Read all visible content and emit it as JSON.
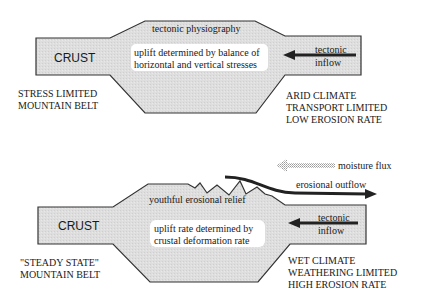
{
  "colors": {
    "crust_fill": "#dcdcdc",
    "outline": "#333333",
    "text": "#1a1a1a",
    "label_box": "#ffffff",
    "arrow": "#222222",
    "moisture_arrow": "#b5b5b5"
  },
  "top_panel": {
    "crust_label": "CRUST",
    "physiography_label": "tectonic physiography",
    "uplift_line1": "uplift determined by balance of",
    "uplift_line2": "horizontal and vertical stresses",
    "inflow_line1": "tectonic",
    "inflow_line2": "inflow",
    "belt_line1": "STRESS LIMITED",
    "belt_line2": "MOUNTAIN BELT",
    "climate_line1": "ARID CLIMATE",
    "climate_line2": "TRANSPORT LIMITED",
    "climate_line3": "LOW EROSION RATE"
  },
  "bottom_panel": {
    "crust_label": "CRUST",
    "moisture_label": "moisture flux",
    "outflow_label": "erosional outflow",
    "relief_label": "youthful erosional relief",
    "uplift_line1": "uplift rate determined by",
    "uplift_line2": "crustal deformation rate",
    "inflow_line1": "tectonic",
    "inflow_line2": "inflow",
    "belt_line1": "\"STEADY STATE\"",
    "belt_line2": "MOUNTAIN BELT",
    "climate_line1": "WET CLIMATE",
    "climate_line2": "WEATHERING LIMITED",
    "climate_line3": "HIGH EROSION RATE"
  }
}
